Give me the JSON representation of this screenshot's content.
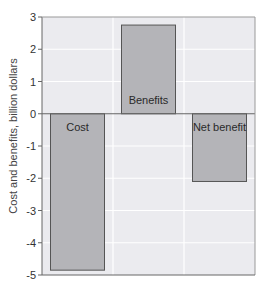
{
  "chart_data": {
    "type": "bar",
    "title": "",
    "xlabel": "",
    "ylabel": "Cost and benefits, billion dollars",
    "ylim": [
      -5,
      3
    ],
    "yticks": [
      3,
      2,
      1,
      0,
      -1,
      -2,
      -3,
      -4,
      -5
    ],
    "ytick_labels": [
      "3",
      "2",
      "1",
      "0",
      "-1",
      "-2",
      "-3",
      "-4",
      "-5"
    ],
    "grid": true,
    "legend": "none",
    "categories": [
      "Cost",
      "Benefits",
      "Net benefit"
    ],
    "values": [
      -4.85,
      2.75,
      -2.1
    ],
    "colors": {
      "plot_background": "#ebebef",
      "bar_fill": "#b4b4b8",
      "bar_stroke": "#555555",
      "gridline": "#ffffff",
      "axis": "#666666"
    }
  }
}
